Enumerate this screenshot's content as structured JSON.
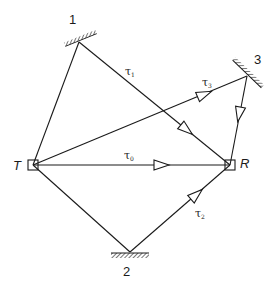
{
  "diagram": {
    "type": "multipath propagation",
    "nodes": {
      "transmitter": {
        "label": "T",
        "x": 33,
        "y": 165
      },
      "receiver": {
        "label": "R",
        "x": 230,
        "y": 165
      }
    },
    "reflectors": [
      {
        "id": "1",
        "label": "1",
        "x": 79,
        "y": 42
      },
      {
        "id": "2",
        "label": "2",
        "x": 130,
        "y": 252
      },
      {
        "id": "3",
        "label": "3",
        "x": 247,
        "y": 76
      }
    ],
    "paths": [
      {
        "id": "direct",
        "label": "τ",
        "sub": "0",
        "route": [
          "T",
          "R"
        ]
      },
      {
        "id": "via1",
        "label": "τ",
        "sub": "1",
        "route": [
          "T",
          "1",
          "R"
        ]
      },
      {
        "id": "via2",
        "label": "τ",
        "sub": "2",
        "route": [
          "T",
          "2",
          "R"
        ]
      },
      {
        "id": "via3",
        "label": "τ",
        "sub": "3",
        "route": [
          "T",
          "3",
          "R"
        ]
      }
    ],
    "colors": {
      "stroke": "#1a1a1a",
      "background": "#ffffff"
    }
  }
}
